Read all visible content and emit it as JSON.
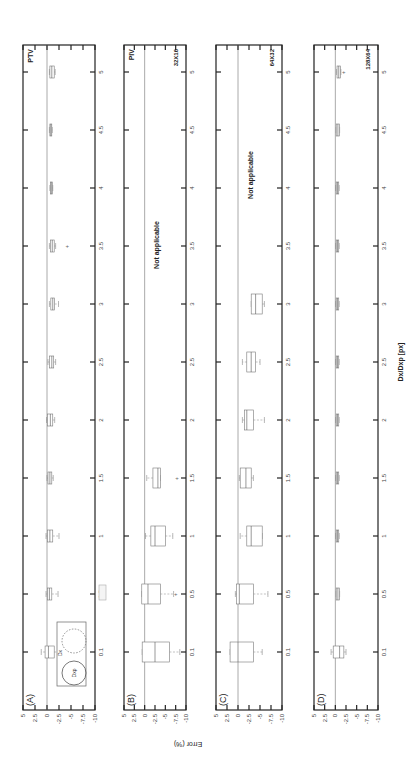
{
  "chart_data": {
    "type": "box",
    "orientation_note": "figure rendered rotated 90 degrees counter-clockwise",
    "xlabel": "Dx/Dxp [px]",
    "ylabel": "Error (%)",
    "x_ticks": [
      "0.1",
      "0.5",
      "1",
      "1.5",
      "2",
      "2.5",
      "3",
      "3.5",
      "4",
      "4.5",
      "5"
    ],
    "y_ticks": [
      "5",
      "2.5",
      "0",
      "-2.5",
      "-5",
      "-7.5",
      "-10"
    ],
    "ylim": [
      -10,
      5
    ],
    "panels": [
      {
        "id": "A",
        "label": "(A)",
        "method": "PTV",
        "window": "",
        "not_applicable_text": "",
        "boxes": [
          {
            "x": "0.1",
            "q1": -1.5,
            "median": -0.3,
            "q3": 0.4,
            "whisker_low": -2.5,
            "whisker_high": 1.2,
            "outliers": []
          },
          {
            "x": "0.5",
            "q1": -1.0,
            "median": -0.5,
            "q3": -0.1,
            "whisker_low": -2.3,
            "whisker_high": 0.2,
            "outliers": []
          },
          {
            "x": "1",
            "q1": -1.2,
            "median": -0.6,
            "q3": -0.1,
            "whisker_low": -2.5,
            "whisker_high": 0.2,
            "outliers": []
          },
          {
            "x": "1.5",
            "q1": -1.0,
            "median": -0.6,
            "q3": -0.2,
            "whisker_low": -1.3,
            "whisker_high": 0.0,
            "outliers": []
          },
          {
            "x": "2",
            "q1": -1.2,
            "median": -0.7,
            "q3": -0.1,
            "whisker_low": -1.6,
            "whisker_high": 0.1,
            "outliers": []
          },
          {
            "x": "2.5",
            "q1": -1.4,
            "median": -1.0,
            "q3": -0.5,
            "whisker_low": -1.8,
            "whisker_high": -0.2,
            "outliers": []
          },
          {
            "x": "3",
            "q1": -1.6,
            "median": -1.2,
            "q3": -0.8,
            "whisker_low": -2.4,
            "whisker_high": -0.5,
            "outliers": []
          },
          {
            "x": "3.5",
            "q1": -1.5,
            "median": -1.1,
            "q3": -0.7,
            "whisker_low": -1.8,
            "whisker_high": -0.5,
            "outliers": [
              -4.2
            ]
          },
          {
            "x": "4",
            "q1": -1.1,
            "median": -0.9,
            "q3": -0.7,
            "whisker_low": -1.2,
            "whisker_high": -0.6,
            "outliers": []
          },
          {
            "x": "4.5",
            "q1": -1.0,
            "median": -0.8,
            "q3": -0.6,
            "whisker_low": -1.1,
            "whisker_high": -0.5,
            "outliers": []
          },
          {
            "x": "5",
            "q1": -1.5,
            "median": -1.0,
            "q3": -0.6,
            "whisker_low": -1.7,
            "whisker_high": -0.5,
            "outliers": []
          }
        ],
        "inset": {
          "labels": [
            "Dx",
            "Dxp"
          ]
        }
      },
      {
        "id": "B",
        "label": "(B)",
        "method": "PIV",
        "window": "32X16",
        "not_applicable_text": "Not applicable",
        "boxes": [
          {
            "x": "0.1",
            "q1": -6.0,
            "median": -2.5,
            "q3": 0.6,
            "whisker_low": -8.5,
            "whisker_high": 0.6,
            "outliers": []
          },
          {
            "x": "0.5",
            "q1": -3.8,
            "median": -0.8,
            "q3": 0.7,
            "whisker_low": -7.0,
            "whisker_high": 0.7,
            "outliers": [
              -7.5
            ]
          },
          {
            "x": "1",
            "q1": -5.0,
            "median": -2.5,
            "q3": -1.5,
            "whisker_low": -6.8,
            "whisker_high": -0.2,
            "outliers": []
          },
          {
            "x": "1.5",
            "q1": -3.8,
            "median": -3.2,
            "q3": -2.0,
            "whisker_low": -3.8,
            "whisker_high": -0.5,
            "outliers": [
              -7.8
            ]
          }
        ]
      },
      {
        "id": "C",
        "label": "(C)",
        "method": "",
        "window": "64X32",
        "not_applicable_text": "Not applicable",
        "boxes": [
          {
            "x": "0.1",
            "q1": -3.5,
            "median": 0.0,
            "q3": 1.8,
            "whisker_low": -5.5,
            "whisker_high": 1.8,
            "outliers": []
          },
          {
            "x": "0.5",
            "q1": -3.5,
            "median": -0.3,
            "q3": 0.3,
            "whisker_low": -6.8,
            "whisker_high": 0.6,
            "outliers": []
          },
          {
            "x": "1",
            "q1": -5.5,
            "median": -3.0,
            "q3": -2.0,
            "whisker_low": -5.5,
            "whisker_high": -0.5,
            "outliers": []
          },
          {
            "x": "1.5",
            "q1": -3.0,
            "median": -1.8,
            "q3": -0.5,
            "whisker_low": -3.5,
            "whisker_high": -0.3,
            "outliers": []
          },
          {
            "x": "2",
            "q1": -3.5,
            "median": -2.0,
            "q3": -1.5,
            "whisker_low": -6.0,
            "whisker_high": -1.0,
            "outliers": []
          },
          {
            "x": "2.5",
            "q1": -4.0,
            "median": -3.0,
            "q3": -2.0,
            "whisker_low": -5.0,
            "whisker_high": -1.0,
            "outliers": []
          },
          {
            "x": "3",
            "q1": -5.5,
            "median": -4.0,
            "q3": -3.0,
            "whisker_low": -6.0,
            "whisker_high": -3.0,
            "outliers": []
          }
        ]
      },
      {
        "id": "D",
        "label": "(D)",
        "method": "",
        "window": "128X64",
        "not_applicable_text": "",
        "boxes": [
          {
            "x": "0.1",
            "q1": -2.0,
            "median": -1.0,
            "q3": 0.5,
            "whisker_low": -2.5,
            "whisker_high": 1.0,
            "outliers": []
          },
          {
            "x": "0.5",
            "q1": -1.0,
            "median": -0.6,
            "q3": -0.2,
            "whisker_low": -1.0,
            "whisker_high": -0.2,
            "outliers": []
          },
          {
            "x": "1",
            "q1": -0.8,
            "median": -0.5,
            "q3": -0.2,
            "whisker_low": -0.9,
            "whisker_high": -0.1,
            "outliers": []
          },
          {
            "x": "1.5",
            "q1": -0.8,
            "median": -0.5,
            "q3": -0.2,
            "whisker_low": -0.9,
            "whisker_high": -0.1,
            "outliers": []
          },
          {
            "x": "2",
            "q1": -0.8,
            "median": -0.5,
            "q3": -0.2,
            "whisker_low": -0.9,
            "whisker_high": -0.1,
            "outliers": []
          },
          {
            "x": "2.5",
            "q1": -0.8,
            "median": -0.5,
            "q3": -0.2,
            "whisker_low": -0.9,
            "whisker_high": -0.1,
            "outliers": []
          },
          {
            "x": "3",
            "q1": -0.8,
            "median": -0.5,
            "q3": -0.2,
            "whisker_low": -0.9,
            "whisker_high": -0.1,
            "outliers": []
          },
          {
            "x": "3.5",
            "q1": -0.8,
            "median": -0.5,
            "q3": -0.2,
            "whisker_low": -0.9,
            "whisker_high": -0.1,
            "outliers": []
          },
          {
            "x": "4",
            "q1": -0.8,
            "median": -0.5,
            "q3": -0.2,
            "whisker_low": -0.9,
            "whisker_high": -0.1,
            "outliers": []
          },
          {
            "x": "4.5",
            "q1": -1.0,
            "median": -0.6,
            "q3": -0.2,
            "whisker_low": -1.0,
            "whisker_high": -0.2,
            "outliers": []
          },
          {
            "x": "5",
            "q1": -1.2,
            "median": -0.8,
            "q3": -0.4,
            "whisker_low": -1.3,
            "whisker_high": -0.3,
            "outliers": [
              -2.0
            ]
          }
        ]
      }
    ]
  }
}
